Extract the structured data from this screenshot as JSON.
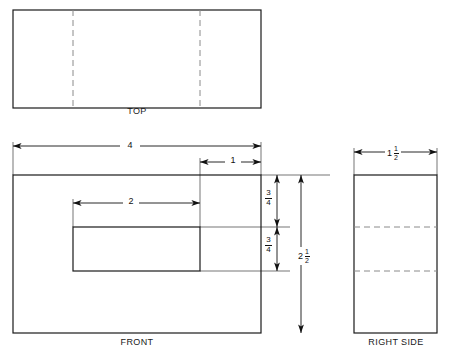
{
  "drawing": {
    "title_domain": "orthographic-projection",
    "stroke_color": "#1a1a1a",
    "hidden_line_color": "#8a8a8a",
    "dimension_line_color": "#1a1a1a",
    "background": "#ffffff",
    "views": [
      {
        "id": "top",
        "label": "TOP",
        "outline": {
          "x": 13,
          "y": 10,
          "width": 248,
          "height": 98
        },
        "hidden_lines": [
          {
            "orientation": "vertical",
            "x": 73
          },
          {
            "orientation": "vertical",
            "x": 200
          }
        ]
      },
      {
        "id": "front",
        "label": "FRONT",
        "outline": {
          "x": 13,
          "y": 175,
          "width": 248,
          "height": 158
        },
        "slot": {
          "x": 73,
          "y": 227,
          "width": 127,
          "height": 44
        }
      },
      {
        "id": "right_side",
        "label": "RIGHT SIDE",
        "outline": {
          "x": 354,
          "y": 175,
          "width": 83,
          "height": 158
        },
        "hidden_lines": [
          {
            "orientation": "horizontal",
            "y": 227
          },
          {
            "orientation": "horizontal",
            "y": 271
          }
        ]
      }
    ],
    "dimensions": [
      {
        "id": "overall-width",
        "value": "4",
        "whole": "4",
        "numerator": "",
        "denominator": "",
        "view": "front",
        "orientation": "horizontal"
      },
      {
        "id": "right-offset",
        "value": "1",
        "whole": "1",
        "numerator": "",
        "denominator": "",
        "view": "front",
        "orientation": "horizontal"
      },
      {
        "id": "slot-width",
        "value": "2",
        "whole": "2",
        "numerator": "",
        "denominator": "",
        "view": "front",
        "orientation": "horizontal"
      },
      {
        "id": "top-to-slot",
        "value": "3/4",
        "whole": "",
        "numerator": "3",
        "denominator": "4",
        "view": "front",
        "orientation": "vertical"
      },
      {
        "id": "slot-height",
        "value": "3/4",
        "whole": "",
        "numerator": "3",
        "denominator": "4",
        "view": "front",
        "orientation": "vertical"
      },
      {
        "id": "overall-height",
        "value": "2 1/2",
        "whole": "2",
        "numerator": "1",
        "denominator": "2",
        "view": "front",
        "orientation": "vertical"
      },
      {
        "id": "overall-depth",
        "value": "1 1/2",
        "whole": "1",
        "numerator": "1",
        "denominator": "2",
        "view": "right_side",
        "orientation": "horizontal"
      }
    ]
  }
}
